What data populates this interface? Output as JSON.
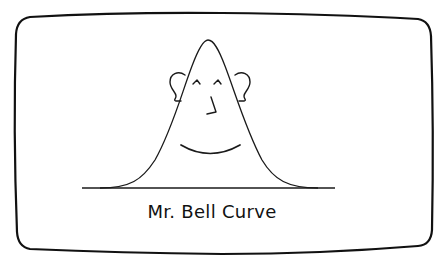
{
  "figure": {
    "caption": "Mr. Bell Curve",
    "colors": {
      "background": "#ffffff",
      "frame": "#111111",
      "ink": "#1a1a1a"
    },
    "elements": {
      "frame": "rounded-bulging-rectangle",
      "curve": "gaussian-bell-curve",
      "baseline": "horizontal-axis-line",
      "face": [
        "left-ear",
        "right-ear",
        "left-eye",
        "right-eye",
        "nose",
        "smile"
      ]
    }
  }
}
